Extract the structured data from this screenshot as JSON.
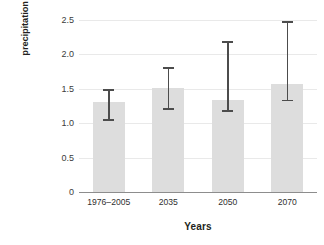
{
  "chart_data": {
    "type": "bar",
    "title": "",
    "xlabel": "Years",
    "ylabel": "Maximum 24-hour precipitation (inches)",
    "ylabel_line1": "Maximum 24 -hour",
    "ylabel_line2": "precipitation (inches)",
    "categories": [
      "1976–2005",
      "2035",
      "2050",
      "2070"
    ],
    "values": [
      1.31,
      1.51,
      1.33,
      1.57
    ],
    "error_upper": [
      1.49,
      1.81,
      2.19,
      2.48
    ],
    "error_lower": [
      1.06,
      1.22,
      1.19,
      1.34
    ],
    "ylim": [
      0,
      2.5
    ],
    "yticks": [
      0,
      0.5,
      1.0,
      1.5,
      2.0,
      2.5
    ],
    "ytick_labels": [
      "0",
      "0.5",
      "1.0",
      "1.5",
      "2.0",
      "2.5"
    ],
    "grid": true,
    "grid_axis": "y",
    "legend": false,
    "legend_position": "none",
    "bar_color": "#dddddd",
    "error_color": "#4c4c4c",
    "grid_color": "#e9e9e9",
    "axis_color": "#8d8d8d",
    "background": "#ffffff",
    "series": [
      {
        "name": "Maximum 24-hour precipitation",
        "values": [
          1.31,
          1.51,
          1.33,
          1.57
        ]
      }
    ],
    "points": [
      {
        "category": "1976–2005",
        "value": 1.31,
        "err_low": 1.06,
        "err_high": 1.49
      },
      {
        "category": "2035",
        "value": 1.51,
        "err_low": 1.22,
        "err_high": 1.81
      },
      {
        "category": "2050",
        "value": 1.33,
        "err_low": 1.19,
        "err_high": 2.19
      },
      {
        "category": "2070",
        "value": 1.57,
        "err_low": 1.34,
        "err_high": 2.48
      }
    ]
  }
}
